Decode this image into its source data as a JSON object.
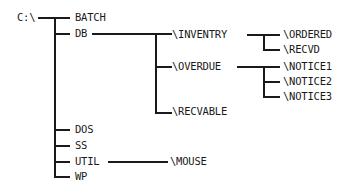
{
  "diagram": {
    "type": "directory-tree",
    "root": "C:\\",
    "level1": [
      "BATCH",
      "DB",
      "DOS",
      "SS",
      "UTIL",
      "WP"
    ],
    "db_children": [
      "\\INVENTRY",
      "\\OVERDUE",
      "\\RECVABLE"
    ],
    "inventry_children": [
      "\\ORDERED",
      "\\RECVD"
    ],
    "overdue_children": [
      "\\NOTICE1",
      "\\NOTICE2",
      "\\NOTICE3"
    ],
    "util_children": [
      "\\MOUSE"
    ],
    "line_color": "#1a1a1a"
  }
}
